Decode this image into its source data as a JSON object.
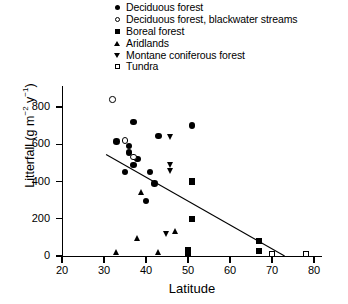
{
  "legend": {
    "position": "top-center",
    "items": [
      {
        "label": "Deciduous forest",
        "marker": "filled-circle",
        "key": "deciduous"
      },
      {
        "label": "Deciduous forest, blackwater streams",
        "marker": "open-circle",
        "key": "deciduous_blackwater"
      },
      {
        "label": "Boreal forest",
        "marker": "filled-square",
        "key": "boreal"
      },
      {
        "label": "Aridlands",
        "marker": "filled-triangle-up",
        "key": "aridlands"
      },
      {
        "label": "Montane coniferous forest",
        "marker": "filled-triangle-down",
        "key": "montane"
      },
      {
        "label": "Tundra",
        "marker": "open-square",
        "key": "tundra"
      }
    ]
  },
  "chart_data": {
    "type": "scatter",
    "title": "",
    "xlabel": "Latitude",
    "ylabel": "Litterfall (g m-2 y-1)",
    "xlim": [
      20,
      80
    ],
    "ylim": [
      0,
      900
    ],
    "xticks": [
      20,
      30,
      40,
      50,
      60,
      70,
      80
    ],
    "yticks": [
      0,
      200,
      400,
      600,
      800
    ],
    "grid": false,
    "series": [
      {
        "name": "Deciduous forest",
        "marker": "filled-circle",
        "points": [
          [
            37,
            720
          ],
          [
            33,
            615
          ],
          [
            36,
            590
          ],
          [
            43,
            645
          ],
          [
            38,
            520
          ],
          [
            37,
            490
          ],
          [
            35,
            450
          ],
          [
            41,
            450
          ],
          [
            42,
            390
          ],
          [
            40,
            295
          ],
          [
            51,
            700
          ],
          [
            36,
            555
          ]
        ]
      },
      {
        "name": "Deciduous forest, blackwater streams",
        "marker": "open-circle",
        "points": [
          [
            32,
            840
          ],
          [
            35,
            620
          ],
          [
            37,
            530
          ]
        ]
      },
      {
        "name": "Boreal forest",
        "marker": "filled-square",
        "points": [
          [
            51,
            400
          ],
          [
            51,
            200
          ],
          [
            67,
            80
          ],
          [
            67,
            25
          ],
          [
            50,
            30
          ],
          [
            50,
            10
          ]
        ]
      },
      {
        "name": "Aridlands",
        "marker": "filled-triangle-up",
        "points": [
          [
            39,
            340
          ],
          [
            47,
            130
          ],
          [
            33,
            15
          ],
          [
            43,
            15
          ],
          [
            38,
            90
          ]
        ]
      },
      {
        "name": "Montane coniferous forest",
        "marker": "filled-triangle-down",
        "points": [
          [
            46,
            640
          ],
          [
            46,
            490
          ],
          [
            46,
            455
          ],
          [
            45,
            120
          ]
        ]
      },
      {
        "name": "Tundra",
        "marker": "open-square",
        "points": [
          [
            70,
            10
          ],
          [
            78,
            10
          ]
        ]
      }
    ],
    "trendline": {
      "x0": 30.5,
      "y0": 545,
      "x1": 73,
      "y1": 0,
      "style": "solid"
    }
  }
}
